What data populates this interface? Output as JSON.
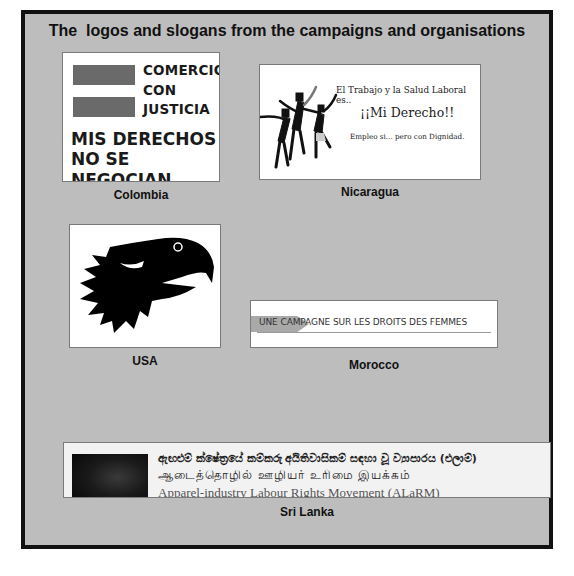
{
  "title": "The  logos and slogans from the campaigns and organisations",
  "panels": {
    "colombia": {
      "caption": "Colombia",
      "lines": [
        "COMERCIO",
        "CON",
        "JUSTICIA",
        "MIS DERECHOS",
        "NO SE NEGOCIAN"
      ]
    },
    "nicaragua": {
      "caption": "Nicaragua",
      "lines": [
        "El Trabajo y la Salud Laboral es..",
        "¡¡Mi Derecho!!",
        "Empleo si... pero con Dignidad."
      ]
    },
    "usa": {
      "caption": "USA",
      "icon": "eagle-head-icon"
    },
    "morocco": {
      "caption": "Morocco",
      "text": "UNE CAMPAGNE SUR LES DROITS DES FEMMES"
    },
    "srilanka": {
      "caption": "Sri Lanka",
      "lines": [
        "ඇඟළුම් ක්ෂේත්‍රයේ කම්කරු අයිතිවාසිකම් සඳහා වූ ව්‍යාපාරය (එලාම්)",
        "ஆடைத்தொழில் ஊழியர் உரிமை இயக்கம்",
        "Apparel-industry Labour Rights Movement (ALaRM)"
      ]
    }
  },
  "colors": {
    "frame_border": "#111111",
    "frame_bg": "#bdbdbd",
    "panel_bg": "#ffffff",
    "colombia_bar": "#6a6a6a"
  }
}
